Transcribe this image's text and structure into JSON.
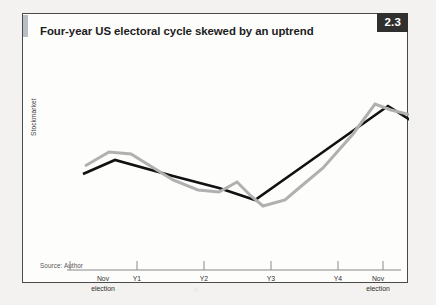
{
  "figure": {
    "number": "2.3",
    "title": "Four-year US electoral cycle skewed by an uptrend",
    "source": "Source: Author",
    "accent_color": "#b9bec4",
    "badge_bg": "#2f2f2f",
    "border_color": "#4a4a4a",
    "page_bg": "#f3f2f0"
  },
  "chart_data": {
    "type": "line",
    "title": "Four-year US electoral cycle skewed by an uptrend",
    "xlabel": "",
    "ylabel": "Stockmarket",
    "grid": false,
    "legend": "none",
    "axis_color": "#8a8a8a",
    "categories": [
      "Nov\nelection",
      "Y1",
      "Y2",
      "Y3",
      "Y4",
      "Nov\nelection"
    ],
    "tick_x": [
      47,
      114,
      181,
      248,
      315,
      360
    ],
    "xlim": [
      40,
      386
    ],
    "ylim": [
      0,
      236
    ],
    "series": [
      {
        "name": "trend",
        "color": "#111111",
        "width": 2.6,
        "points": [
          [
            60,
            126
          ],
          [
            92,
            112
          ],
          [
            150,
            128
          ],
          [
            196,
            140
          ],
          [
            232,
            152
          ],
          [
            300,
            104
          ],
          [
            365,
            58
          ],
          [
            400,
            80
          ]
        ]
      },
      {
        "name": "cycle",
        "color": "#b0b0b0",
        "width": 3.0,
        "points": [
          [
            62,
            118
          ],
          [
            86,
            104
          ],
          [
            108,
            106
          ],
          [
            150,
            132
          ],
          [
            175,
            142
          ],
          [
            196,
            144
          ],
          [
            214,
            134
          ],
          [
            228,
            148
          ],
          [
            240,
            158
          ],
          [
            262,
            152
          ],
          [
            276,
            140
          ],
          [
            300,
            120
          ],
          [
            330,
            86
          ],
          [
            352,
            56
          ],
          [
            368,
            62
          ],
          [
            392,
            68
          ]
        ]
      }
    ]
  }
}
